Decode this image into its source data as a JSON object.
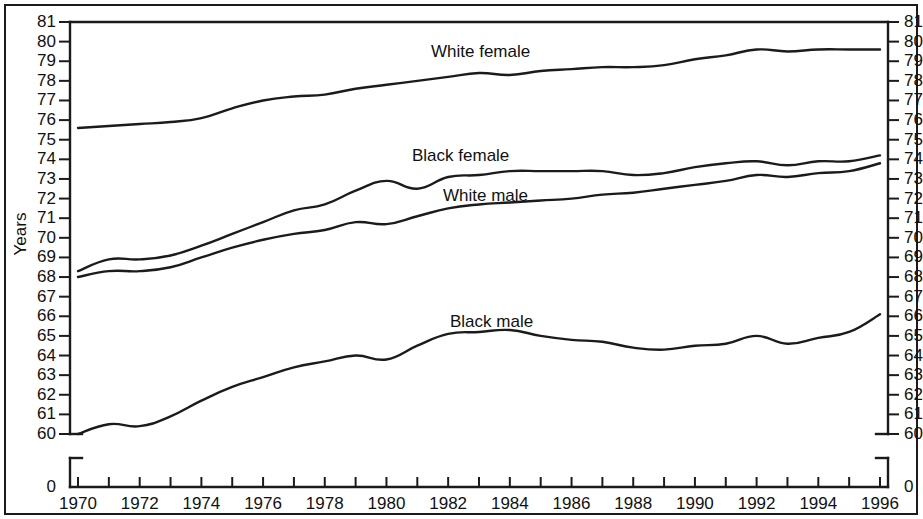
{
  "axis": {
    "ylabel": "Years",
    "y_ticks": [
      81,
      80,
      79,
      78,
      77,
      76,
      75,
      74,
      73,
      72,
      71,
      70,
      69,
      68,
      67,
      66,
      65,
      64,
      63,
      62,
      61,
      60
    ],
    "y_zero_tick": "0",
    "x_ticks": [
      1970,
      1971,
      1972,
      1973,
      1974,
      1975,
      1976,
      1977,
      1978,
      1979,
      1980,
      1981,
      1982,
      1983,
      1984,
      1985,
      1986,
      1987,
      1988,
      1989,
      1990,
      1991,
      1992,
      1993,
      1994,
      1995,
      1996
    ],
    "x_labeled_ticks": [
      1970,
      1972,
      1974,
      1976,
      1978,
      1980,
      1982,
      1984,
      1986,
      1988,
      1990,
      1992,
      1994,
      1996
    ],
    "line_color": "#1b1b1b"
  },
  "series_labels": {
    "white_female": "White female",
    "black_female": "Black female",
    "white_male": "White male",
    "black_male": "Black male"
  },
  "chart_data": {
    "type": "line",
    "title": "",
    "xlabel": "",
    "ylabel": "Years",
    "xlim": [
      1970,
      1996
    ],
    "ylim": [
      59.6,
      81
    ],
    "grid": false,
    "legend": "inline-labels",
    "axis_break": "y-axis broken between 0 and 60",
    "x": [
      1970,
      1971,
      1972,
      1973,
      1974,
      1975,
      1976,
      1977,
      1978,
      1979,
      1980,
      1981,
      1982,
      1983,
      1984,
      1985,
      1986,
      1987,
      1988,
      1989,
      1990,
      1991,
      1992,
      1993,
      1994,
      1995,
      1996
    ],
    "series": [
      {
        "name": "White female",
        "values": [
          75.6,
          75.7,
          75.8,
          75.9,
          76.1,
          76.6,
          77.0,
          77.2,
          77.3,
          77.6,
          77.8,
          78.0,
          78.2,
          78.4,
          78.3,
          78.5,
          78.6,
          78.7,
          78.7,
          78.8,
          79.1,
          79.3,
          79.6,
          79.5,
          79.6,
          79.6,
          79.6
        ]
      },
      {
        "name": "Black female",
        "values": [
          68.3,
          68.9,
          68.9,
          69.1,
          69.6,
          70.2,
          70.8,
          71.4,
          71.7,
          72.4,
          72.9,
          72.5,
          73.1,
          73.2,
          73.4,
          73.4,
          73.4,
          73.4,
          73.2,
          73.3,
          73.6,
          73.8,
          73.9,
          73.7,
          73.9,
          73.9,
          74.2
        ]
      },
      {
        "name": "White male",
        "values": [
          68.0,
          68.3,
          68.3,
          68.5,
          69.0,
          69.5,
          69.9,
          70.2,
          70.4,
          70.8,
          70.7,
          71.1,
          71.5,
          71.7,
          71.8,
          71.9,
          72.0,
          72.2,
          72.3,
          72.5,
          72.7,
          72.9,
          73.2,
          73.1,
          73.3,
          73.4,
          73.8
        ]
      },
      {
        "name": "Black male",
        "values": [
          60.0,
          60.5,
          60.4,
          60.9,
          61.7,
          62.4,
          62.9,
          63.4,
          63.7,
          64.0,
          63.8,
          64.5,
          65.1,
          65.2,
          65.3,
          65.0,
          64.8,
          64.7,
          64.4,
          64.3,
          64.5,
          64.6,
          65.0,
          64.6,
          64.9,
          65.2,
          66.1
        ]
      }
    ]
  }
}
